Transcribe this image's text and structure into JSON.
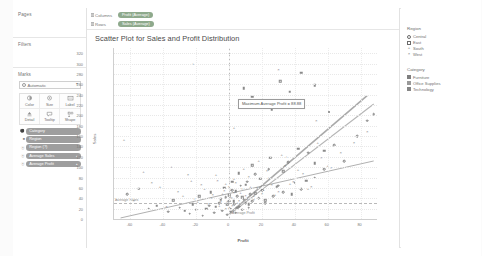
{
  "app": {
    "accent_color": "#8ea98c",
    "pill_gray": "#9e9e9e"
  },
  "left_panel": {
    "pages_label": "Pages",
    "filters_label": "Filters",
    "marks_label": "Marks",
    "marks_type": {
      "value": "Automatic",
      "icon": "automatic-mark-icon",
      "caret": "▾"
    },
    "marks_buttons": [
      {
        "label": "Color",
        "icon": "color-icon"
      },
      {
        "label": "Size",
        "icon": "size-icon"
      },
      {
        "label": "Label",
        "icon": "label-icon"
      },
      {
        "label": "Detail",
        "icon": "detail-icon"
      },
      {
        "label": "Tooltip",
        "icon": "tooltip-icon"
      },
      {
        "label": "Shape",
        "icon": "shape-icon"
      }
    ],
    "marks_pills": [
      {
        "prefix": "⚫",
        "label": "Category",
        "suffix": "",
        "color": "gray"
      },
      {
        "prefix": "■",
        "label": "Region",
        "suffix": "",
        "color": "gray"
      },
      {
        "prefix": "Ⓐ",
        "label": "Region (?)",
        "suffix": "",
        "color": "gray"
      },
      {
        "prefix": "Ⓐ",
        "label": "Average Sales",
        "suffix": "▴",
        "color": "gray"
      },
      {
        "prefix": "Ⓐ",
        "label": "Average Profit",
        "suffix": "▴",
        "color": "gray"
      }
    ]
  },
  "shelves": [
    {
      "label": "Columns",
      "pill": "Profit (Average)"
    },
    {
      "label": "Rows",
      "pill": "Sales (Average)"
    }
  ],
  "chart_data": {
    "type": "scatter",
    "title": "Scatter Plot for Sales and Profit Distribution",
    "xlabel": "Profit",
    "ylabel": "Sales",
    "xlim": [
      -70,
      90
    ],
    "ylim": [
      0,
      330
    ],
    "xticks": [
      -60,
      -40,
      -20,
      0,
      20,
      40,
      60,
      80
    ],
    "yticks": [
      0,
      20,
      40,
      60,
      80,
      100,
      120,
      140,
      160,
      180,
      200,
      220,
      240,
      260,
      280,
      300,
      320
    ],
    "grid": true,
    "legend_position": "right",
    "reference_lines": [
      {
        "orientation": "vertical",
        "label": "Average Profit",
        "value": 0
      },
      {
        "orientation": "horizontal",
        "label": "Average Sales",
        "value": 30
      }
    ],
    "annotation": {
      "text": "Maximum Average Profit = 88.88",
      "x": 6,
      "y": 232
    },
    "series": [
      {
        "name": "Central",
        "shape": "circle-open",
        "points": [
          [
            -62,
            48
          ],
          [
            -49,
            20
          ],
          [
            -37,
            14
          ],
          [
            -30,
            22
          ],
          [
            -24,
            10
          ],
          [
            -20,
            18
          ],
          [
            -16,
            6
          ],
          [
            -12,
            26
          ],
          [
            -9,
            12
          ],
          [
            -6,
            30
          ],
          [
            -4,
            16
          ],
          [
            -2,
            42
          ],
          [
            -1,
            8
          ],
          [
            0,
            34
          ],
          [
            1,
            20
          ],
          [
            2,
            56
          ],
          [
            3,
            28
          ],
          [
            4,
            12
          ],
          [
            5,
            44
          ],
          [
            6,
            24
          ],
          [
            7,
            64
          ],
          [
            8,
            18
          ],
          [
            9,
            38
          ],
          [
            10,
            30
          ],
          [
            11,
            72
          ],
          [
            12,
            22
          ],
          [
            13,
            48
          ],
          [
            14,
            34
          ],
          [
            16,
            86
          ],
          [
            18,
            40
          ],
          [
            20,
            56
          ],
          [
            22,
            30
          ],
          [
            24,
            96
          ],
          [
            27,
            44
          ],
          [
            30,
            64
          ],
          [
            33,
            52
          ],
          [
            36,
            110
          ],
          [
            40,
            70
          ],
          [
            44,
            58
          ],
          [
            48,
            128
          ],
          [
            52,
            80
          ],
          [
            58,
            96
          ],
          [
            64,
            142
          ],
          [
            70,
            112
          ],
          [
            78,
            160
          ],
          [
            84,
            190
          ],
          [
            88,
            202
          ]
        ]
      },
      {
        "name": "East",
        "shape": "square-open",
        "points": [
          [
            -55,
            58
          ],
          [
            -44,
            26
          ],
          [
            -34,
            36
          ],
          [
            -27,
            16
          ],
          [
            -22,
            28
          ],
          [
            -18,
            44
          ],
          [
            -14,
            20
          ],
          [
            -11,
            52
          ],
          [
            -8,
            24
          ],
          [
            -5,
            38
          ],
          [
            -3,
            60
          ],
          [
            -1,
            28
          ],
          [
            0,
            46
          ],
          [
            1,
            14
          ],
          [
            2,
            72
          ],
          [
            3,
            34
          ],
          [
            4,
            54
          ],
          [
            5,
            22
          ],
          [
            6,
            88
          ],
          [
            8,
            42
          ],
          [
            10,
            66
          ],
          [
            12,
            28
          ],
          [
            14,
            104
          ],
          [
            16,
            50
          ],
          [
            19,
            78
          ],
          [
            22,
            36
          ],
          [
            25,
            118
          ],
          [
            29,
            62
          ],
          [
            33,
            92
          ],
          [
            38,
            48
          ],
          [
            42,
            136
          ],
          [
            47,
            74
          ],
          [
            52,
            108
          ],
          [
            58,
            132
          ],
          [
            9,
            252
          ],
          [
            14,
            236
          ],
          [
            20,
            224
          ],
          [
            26,
            212
          ],
          [
            31,
            266
          ],
          [
            37,
            246
          ],
          [
            44,
            282
          ],
          [
            52,
            258
          ]
        ]
      },
      {
        "name": "South",
        "shape": "plus",
        "points": [
          [
            -64,
            152
          ],
          [
            -52,
            90
          ],
          [
            -42,
            62
          ],
          [
            -35,
            100
          ],
          [
            -28,
            44
          ],
          [
            -23,
            74
          ],
          [
            -19,
            32
          ],
          [
            -15,
            58
          ],
          [
            -11,
            40
          ],
          [
            -8,
            84
          ],
          [
            -6,
            26
          ],
          [
            -4,
            48
          ],
          [
            -2,
            68
          ],
          [
            -1,
            34
          ],
          [
            0,
            22
          ],
          [
            1,
            56
          ],
          [
            2,
            40
          ],
          [
            3,
            78
          ],
          [
            5,
            30
          ],
          [
            7,
            50
          ],
          [
            9,
            96
          ],
          [
            11,
            38
          ],
          [
            13,
            62
          ],
          [
            15,
            44
          ],
          [
            18,
            112
          ],
          [
            21,
            56
          ],
          [
            24,
            80
          ],
          [
            28,
            46
          ],
          [
            32,
            124
          ],
          [
            37,
            68
          ],
          [
            42,
            94
          ],
          [
            48,
            58
          ],
          [
            54,
            146
          ],
          [
            60,
            102
          ],
          [
            -22,
            300
          ],
          [
            3,
            176
          ],
          [
            35,
            120
          ]
        ]
      },
      {
        "name": "West",
        "shape": "x",
        "points": [
          [
            -58,
            34
          ],
          [
            -47,
            70
          ],
          [
            -38,
            24
          ],
          [
            -31,
            52
          ],
          [
            -25,
            84
          ],
          [
            -21,
            38
          ],
          [
            -17,
            66
          ],
          [
            -13,
            28
          ],
          [
            -10,
            46
          ],
          [
            -7,
            74
          ],
          [
            -5,
            32
          ],
          [
            -3,
            54
          ],
          [
            -2,
            20
          ],
          [
            0,
            62
          ],
          [
            1,
            40
          ],
          [
            2,
            26
          ],
          [
            3,
            50
          ],
          [
            4,
            70
          ],
          [
            6,
            34
          ],
          [
            8,
            58
          ],
          [
            10,
            44
          ],
          [
            12,
            82
          ],
          [
            15,
            36
          ],
          [
            17,
            60
          ],
          [
            20,
            48
          ],
          [
            23,
            92
          ],
          [
            26,
            66
          ],
          [
            30,
            52
          ],
          [
            34,
            102
          ],
          [
            39,
            72
          ],
          [
            45,
            86
          ],
          [
            50,
            62
          ],
          [
            56,
            118
          ],
          [
            62,
            98
          ],
          [
            30,
            288
          ],
          [
            53,
            190
          ],
          [
            68,
            128
          ],
          [
            76,
            146
          ],
          [
            84,
            168
          ]
        ]
      }
    ],
    "trend_lines": [
      {
        "name": "trend-upper",
        "x1": 0,
        "y1": 10,
        "x2": 84,
        "y2": 238,
        "width": 1.6,
        "color": "#aaaaaa"
      },
      {
        "name": "trend-mid",
        "x1": 0,
        "y1": 8,
        "x2": 88,
        "y2": 222,
        "width": 1.1,
        "color": "#b4b4b4"
      },
      {
        "name": "trend-lower",
        "x1": -66,
        "y1": 2,
        "x2": 88,
        "y2": 112,
        "width": 0.7,
        "color": "#8e8e8e"
      }
    ]
  },
  "legends": [
    {
      "title": "Region",
      "entries": [
        {
          "label": "Central",
          "mark": "circle-open"
        },
        {
          "label": "East",
          "mark": "square-open"
        },
        {
          "label": "South",
          "mark": "plus"
        },
        {
          "label": "West",
          "mark": "x"
        }
      ]
    },
    {
      "title": "Category",
      "entries": [
        {
          "label": "Furniture",
          "mark": "swatch",
          "color": "#7f7f7f"
        },
        {
          "label": "Office Supplies",
          "mark": "swatch",
          "color": "#9a9a9a"
        },
        {
          "label": "Technology",
          "mark": "swatch",
          "color": "#868686"
        }
      ]
    }
  ]
}
